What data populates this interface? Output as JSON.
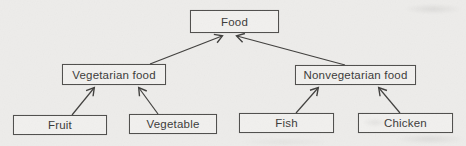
{
  "diagram": {
    "type": "tree-hierarchy",
    "nodes": [
      {
        "id": "food",
        "label": "Food",
        "level": 0
      },
      {
        "id": "vegetarian",
        "label": "Vegetarian food",
        "level": 1,
        "parent": "food"
      },
      {
        "id": "nonvegetarian",
        "label": "Nonvegetarian food",
        "level": 1,
        "parent": "food"
      },
      {
        "id": "fruit",
        "label": "Fruit",
        "level": 2,
        "parent": "vegetarian"
      },
      {
        "id": "vegetable",
        "label": "Vegetable",
        "level": 2,
        "parent": "vegetarian"
      },
      {
        "id": "fish",
        "label": "Fish",
        "level": 2,
        "parent": "nonvegetarian"
      },
      {
        "id": "chicken",
        "label": "Chicken",
        "level": 2,
        "parent": "nonvegetarian"
      }
    ],
    "edges": [
      {
        "from": "Vegetarian food",
        "to": "Food",
        "arrow": "to"
      },
      {
        "from": "Nonvegetarian food",
        "to": "Food",
        "arrow": "to"
      },
      {
        "from": "Fruit",
        "to": "Vegetarian food",
        "arrow": "to"
      },
      {
        "from": "Vegetable",
        "to": "Vegetarian food",
        "arrow": "to"
      },
      {
        "from": "Fish",
        "to": "Nonvegetarian food",
        "arrow": "to"
      },
      {
        "from": "Chicken",
        "to": "Nonvegetarian food",
        "arrow": "to"
      }
    ],
    "colors": {
      "background": "#edecea",
      "box_fill": "#f1f0ee",
      "box_border": "#4f4e4c",
      "line": "#3f3e3c",
      "text": "#3a3938"
    }
  }
}
